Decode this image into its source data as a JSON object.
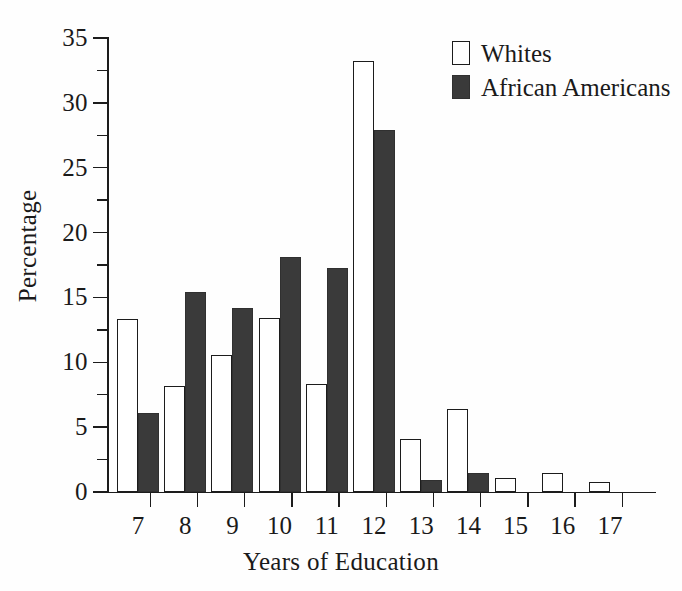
{
  "chart_data": {
    "type": "bar",
    "title": "",
    "xlabel": "Years of Education",
    "ylabel": "Percentage",
    "categories": [
      "7",
      "8",
      "9",
      "10",
      "11",
      "12",
      "13",
      "14",
      "15",
      "16",
      "17"
    ],
    "series": [
      {
        "name": "Whites",
        "color": "#ffffff",
        "values": [
          13.3,
          8.2,
          10.6,
          13.4,
          8.3,
          33.2,
          4.1,
          6.4,
          1.1,
          1.5,
          0.8
        ]
      },
      {
        "name": "African Americans",
        "color": "#3a3a3a",
        "values": [
          6.1,
          15.4,
          14.2,
          18.1,
          17.3,
          27.9,
          0.9,
          1.5,
          0,
          0,
          0
        ]
      }
    ],
    "ylim": [
      0,
      35
    ],
    "y_major_ticks": [
      0,
      5,
      10,
      15,
      20,
      25,
      30,
      35
    ],
    "y_minor_ticks": [
      2.5,
      7.5,
      12.5,
      17.5,
      22.5,
      27.5,
      32.5
    ],
    "y_tick_labels": [
      "0",
      "5",
      "10",
      "15",
      "20",
      "25",
      "30",
      "35"
    ],
    "grid": false,
    "legend_position": "top-right"
  },
  "legend": {
    "items": [
      {
        "label": "Whites",
        "swatch": "open-square-swatch"
      },
      {
        "label": "African Americans",
        "swatch": "filled-square-swatch"
      }
    ]
  },
  "axes": {
    "x_title": "Years of Education",
    "y_title": "Percentage"
  }
}
